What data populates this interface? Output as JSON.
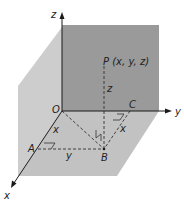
{
  "diagram": {
    "labels": {
      "z_axis": "z",
      "y_axis": "y",
      "x_axis": "x",
      "origin": "O",
      "point_p": "P (x, y, z)",
      "point_a": "A",
      "point_b": "B",
      "point_c": "C",
      "seg_pb": "z",
      "seg_oa": "x",
      "seg_ab": "y",
      "seg_cb": "x"
    },
    "colors": {
      "back_wall": "#9a9a9a",
      "left_wall": "#cdcdcd",
      "floor": "#c2c2c2",
      "axis": "#1a1a1a",
      "dashed": "#333333"
    }
  }
}
